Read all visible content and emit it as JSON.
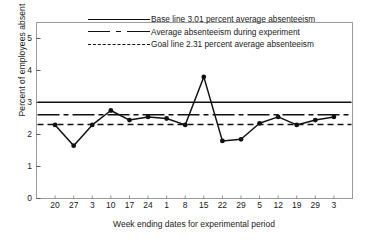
{
  "chart_data": {
    "type": "line",
    "title": "",
    "xlabel": "Week ending dates for experimental period",
    "ylabel": "Percent of employees absent",
    "categories": [
      "20",
      "27",
      "3",
      "10",
      "17",
      "24",
      "1",
      "8",
      "15",
      "22",
      "29",
      "5",
      "12",
      "19",
      "29",
      "3"
    ],
    "values": [
      2.3,
      1.65,
      2.3,
      2.75,
      2.45,
      2.55,
      2.5,
      2.3,
      3.8,
      1.8,
      1.85,
      2.35,
      2.55,
      2.3,
      2.45,
      2.55
    ],
    "series": [
      {
        "name": "Percent of employees absent",
        "values": [
          2.3,
          1.65,
          2.3,
          2.75,
          2.45,
          2.55,
          2.5,
          2.3,
          3.8,
          1.8,
          1.85,
          2.35,
          2.55,
          2.3,
          2.45,
          2.55
        ]
      }
    ],
    "ylim": [
      0,
      5.5
    ],
    "yticks": [
      0,
      1,
      2,
      3,
      4,
      5
    ],
    "yticklabels": [
      "0",
      "1",
      "2",
      "3",
      "4",
      "5"
    ],
    "grid": false,
    "legend_position": "top-center",
    "reference_lines": [
      {
        "label": "Base line 3.01 percent average absenteeism",
        "value": 3.01,
        "style": "solid"
      },
      {
        "label": "Average absenteeism during experiment",
        "value": 2.62,
        "style": "dash-dot"
      },
      {
        "label": "Goal line 2.31 percent average absenteeism",
        "value": 2.31,
        "style": "dashed"
      }
    ],
    "legend": [
      {
        "label": "Base line 3.01 percent average absenteeism",
        "style": "solid"
      },
      {
        "label": "Average absenteeism during experiment",
        "style": "dash-dot"
      },
      {
        "label": "Goal line 2.31 percent average absenteeism",
        "style": "dashed"
      }
    ],
    "colors": {
      "line": "#111111",
      "marker": "#111111",
      "axis": "#888888",
      "text": "#1a1a1a"
    }
  }
}
